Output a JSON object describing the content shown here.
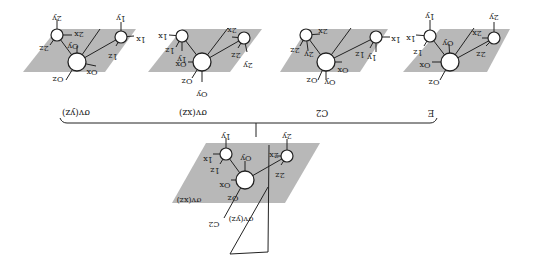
{
  "orientation": "rotated-180",
  "operations": {
    "panel_1": "σv(yz)",
    "panel_2": "σv(xz)",
    "panel_3": "C2",
    "panel_4": "E"
  },
  "bottom": {
    "plane_xz": "σv(xz)",
    "plane_yz": "σv(yz)",
    "axis": "C2"
  },
  "panels": [
    {
      "operation": "σv(yz)",
      "labels": {
        "a_up": "2y",
        "a_side": "2x",
        "a_down": "2z",
        "b_up": "1y",
        "b_side": "1x",
        "b_down": "1z",
        "o_up": "Oy",
        "o_side": "Ox",
        "o_down": "Oz"
      }
    },
    {
      "operation": "σv(xz)",
      "labels": {
        "a_side": "1x",
        "a_down": "1z",
        "a_y": "1y",
        "b_up": "2x",
        "b_down": "2z",
        "b_y": "2y",
        "o_side": "Ox",
        "o_down": "Oz",
        "o_y": "Oy"
      }
    },
    {
      "operation": "C2",
      "labels": {
        "a_side": "2x",
        "a_down": "2z",
        "a_y": "2y",
        "b_side": "1x",
        "b_down": "1z",
        "b_y": "1y",
        "o_side": "Ox",
        "o_down": "Oz",
        "o_y": "Oy"
      }
    },
    {
      "operation": "E",
      "labels": {
        "a_up": "1y",
        "a_side": "1x",
        "a_down": "1z",
        "b_up": "2y",
        "b_side": "2x",
        "b_down": "2z",
        "o_up": "Oy",
        "o_side": "Ox",
        "o_down": "Oz"
      }
    }
  ],
  "bottom_labels": {
    "a_up": "1y",
    "a_side": "1x",
    "a_down": "1z",
    "b_up": "2y",
    "b_side": "2x",
    "b_down": "2z",
    "o_up": "Oy",
    "o_side": "Ox",
    "o_down": "Oz"
  }
}
